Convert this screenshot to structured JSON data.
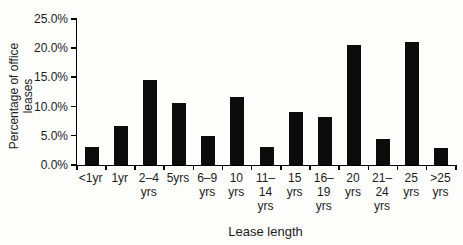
{
  "chart_data": {
    "type": "bar",
    "title": "",
    "xlabel": "Lease length",
    "ylabel": "Percentage of office leases",
    "categories": [
      "<1yr",
      "1yr",
      "2–4 yrs",
      "5yrs",
      "6–9 yrs",
      "10 yrs",
      "11–14 yrs",
      "15 yrs",
      "16–19 yrs",
      "20 yrs",
      "21–24 yrs",
      "25 yrs",
      ">25 yrs"
    ],
    "category_label_lines": [
      [
        "<1yr"
      ],
      [
        "1yr"
      ],
      [
        "2–4",
        "yrs"
      ],
      [
        "5yrs"
      ],
      [
        "6–9",
        "yrs"
      ],
      [
        "10",
        "yrs"
      ],
      [
        "11–",
        "14",
        "yrs"
      ],
      [
        "15",
        "yrs"
      ],
      [
        "16–",
        "19",
        "yrs"
      ],
      [
        "20",
        "yrs"
      ],
      [
        "21–",
        "24",
        "yrs"
      ],
      [
        "25",
        "yrs"
      ],
      [
        ">25",
        "yrs"
      ]
    ],
    "values": [
      3.1,
      6.7,
      14.6,
      10.7,
      5.0,
      11.6,
      3.1,
      9.0,
      8.2,
      20.6,
      4.5,
      21.1,
      2.9
    ],
    "unit": "%",
    "ylim": [
      0,
      25
    ],
    "yticks": [
      0,
      5,
      10,
      15,
      20,
      25
    ],
    "ytick_labels": [
      "0.0%",
      "5.0%",
      "10.0%",
      "15.0%",
      "20.0%",
      "25.0%"
    ],
    "bar_color": "#0c0c0c",
    "axis_color": "#000000",
    "text_color": "#1c1c1c",
    "grid": false,
    "legend": null
  }
}
